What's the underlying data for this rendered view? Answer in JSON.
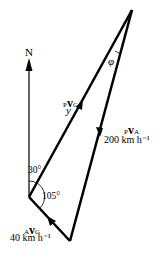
{
  "diagram": {
    "north_label": "N",
    "angle_phi": "φ",
    "angle_30": "30°",
    "angle_105": "105°",
    "vec_pg": {
      "pre_sub": "P",
      "sym": "v",
      "post_sub": "G",
      "unknown": "y"
    },
    "vec_pa": {
      "pre_sub": "P",
      "sym": "v",
      "post_sub": "A",
      "magnitude": "200 km h⁻¹"
    },
    "vec_ag": {
      "pre_sub": "A",
      "sym": "v",
      "post_sub": "G",
      "magnitude": "40 km h⁻¹"
    },
    "colors": {
      "line": "#000000",
      "north": "#333333"
    }
  }
}
